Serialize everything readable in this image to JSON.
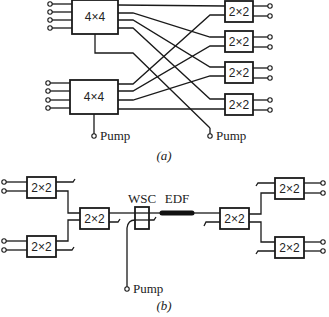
{
  "figure": {
    "part_a": {
      "caption": "(a)",
      "splitter_4x4_label": "4×4",
      "coupler_2x2_label": "2×2",
      "pump_label_1": "Pump",
      "pump_label_2": "Pump",
      "splitters": [
        {
          "label": "4×4",
          "inputs": 4,
          "outputs": 4
        },
        {
          "label": "4×4",
          "inputs": 4,
          "outputs": 4
        }
      ],
      "couplers": [
        {
          "label": "2×2"
        },
        {
          "label": "2×2"
        },
        {
          "label": "2×2"
        },
        {
          "label": "2×2"
        }
      ]
    },
    "part_b": {
      "caption": "(b)",
      "coupler_label": "2×2",
      "wsc_label": "WSC",
      "edf_label": "EDF",
      "pump_label": "Pump"
    },
    "colors": {
      "line": "#1a1a1a",
      "background": "#ffffff"
    }
  }
}
